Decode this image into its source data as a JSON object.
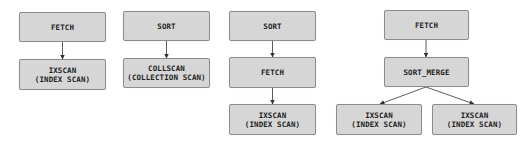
{
  "diagram": {
    "type": "query-plan-trees",
    "colors": {
      "node_fill": "#d6d6d6",
      "node_border": "#8c8c8c",
      "text": "#1e1e1e",
      "edge": "#333333"
    },
    "plans": [
      {
        "nodes": [
          {
            "id": "p1_fetch",
            "line1": "FETCH",
            "line2": ""
          },
          {
            "id": "p1_ixscan",
            "line1": "IXSCAN",
            "line2": "(INDEX SCAN)"
          }
        ],
        "edges": [
          [
            "p1_fetch",
            "p1_ixscan"
          ]
        ]
      },
      {
        "nodes": [
          {
            "id": "p2_sort",
            "line1": "SORT",
            "line2": ""
          },
          {
            "id": "p2_collscan",
            "line1": "COLLSCAN",
            "line2": "(COLLECTION SCAN)"
          }
        ],
        "edges": [
          [
            "p2_sort",
            "p2_collscan"
          ]
        ]
      },
      {
        "nodes": [
          {
            "id": "p3_sort",
            "line1": "SORT",
            "line2": ""
          },
          {
            "id": "p3_fetch",
            "line1": "FETCH",
            "line2": ""
          },
          {
            "id": "p3_ixscan",
            "line1": "IXSCAN",
            "line2": "(INDEX SCAN)"
          }
        ],
        "edges": [
          [
            "p3_sort",
            "p3_fetch"
          ],
          [
            "p3_fetch",
            "p3_ixscan"
          ]
        ]
      },
      {
        "nodes": [
          {
            "id": "p4_fetch",
            "line1": "FETCH",
            "line2": ""
          },
          {
            "id": "p4_sortmerge",
            "line1": "SORT_MERGE",
            "line2": ""
          },
          {
            "id": "p4_ixscan_left",
            "line1": "IXSCAN",
            "line2": "(INDEX SCAN)"
          },
          {
            "id": "p4_ixscan_right",
            "line1": "IXSCAN",
            "line2": "(INDEX SCAN)"
          }
        ],
        "edges": [
          [
            "p4_fetch",
            "p4_sortmerge"
          ],
          [
            "p4_sortmerge",
            "p4_ixscan_left"
          ],
          [
            "p4_sortmerge",
            "p4_ixscan_right"
          ]
        ]
      }
    ]
  }
}
